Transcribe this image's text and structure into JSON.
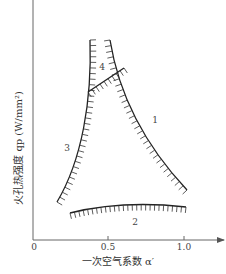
{
  "chart_data": {
    "type": "line",
    "title": "",
    "xlabel": "一次空气系数 α′",
    "ylabel": "火孔热强度 qp (W/mm²)",
    "xlim": [
      0,
      1.2
    ],
    "x_ticks": [
      "0",
      "0.5",
      "1.0"
    ],
    "y_ticks": [],
    "grid": false,
    "legend": null,
    "series": [
      {
        "name": "1",
        "meaning": "boundary curve 1 (hatched right side)",
        "points": [
          [
            0.52,
            0.98
          ],
          [
            0.58,
            0.8
          ],
          [
            0.7,
            0.55
          ],
          [
            0.85,
            0.32
          ],
          [
            1.02,
            0.16
          ]
        ]
      },
      {
        "name": "2",
        "meaning": "boundary curve 2 (hatched below)",
        "points": [
          [
            0.24,
            0.1
          ],
          [
            0.4,
            0.13
          ],
          [
            0.6,
            0.14
          ],
          [
            0.8,
            0.14
          ],
          [
            1.01,
            0.13
          ]
        ]
      },
      {
        "name": "3",
        "meaning": "boundary curve 3 (hatched left side)",
        "points": [
          [
            0.38,
            0.98
          ],
          [
            0.38,
            0.75
          ],
          [
            0.35,
            0.55
          ],
          [
            0.3,
            0.35
          ],
          [
            0.16,
            0.14
          ]
        ]
      },
      {
        "name": "4",
        "meaning": "boundary curve 4 (hatched above)",
        "points": [
          [
            0.36,
            0.7
          ],
          [
            0.45,
            0.74
          ],
          [
            0.54,
            0.78
          ],
          [
            0.59,
            0.81
          ]
        ]
      }
    ],
    "annotations": [
      "1",
      "2",
      "3",
      "4"
    ]
  },
  "axis": {
    "xlabel": "一次空气系数 α′",
    "ylabel": "火孔热强度 qp (W/mm²)",
    "ticks": [
      "0",
      "0.5",
      "1.0"
    ]
  },
  "labels": {
    "c1": "1",
    "c2": "2",
    "c3": "3",
    "c4": "4"
  },
  "colors": {
    "line": "#222222",
    "axis": "#555555"
  }
}
